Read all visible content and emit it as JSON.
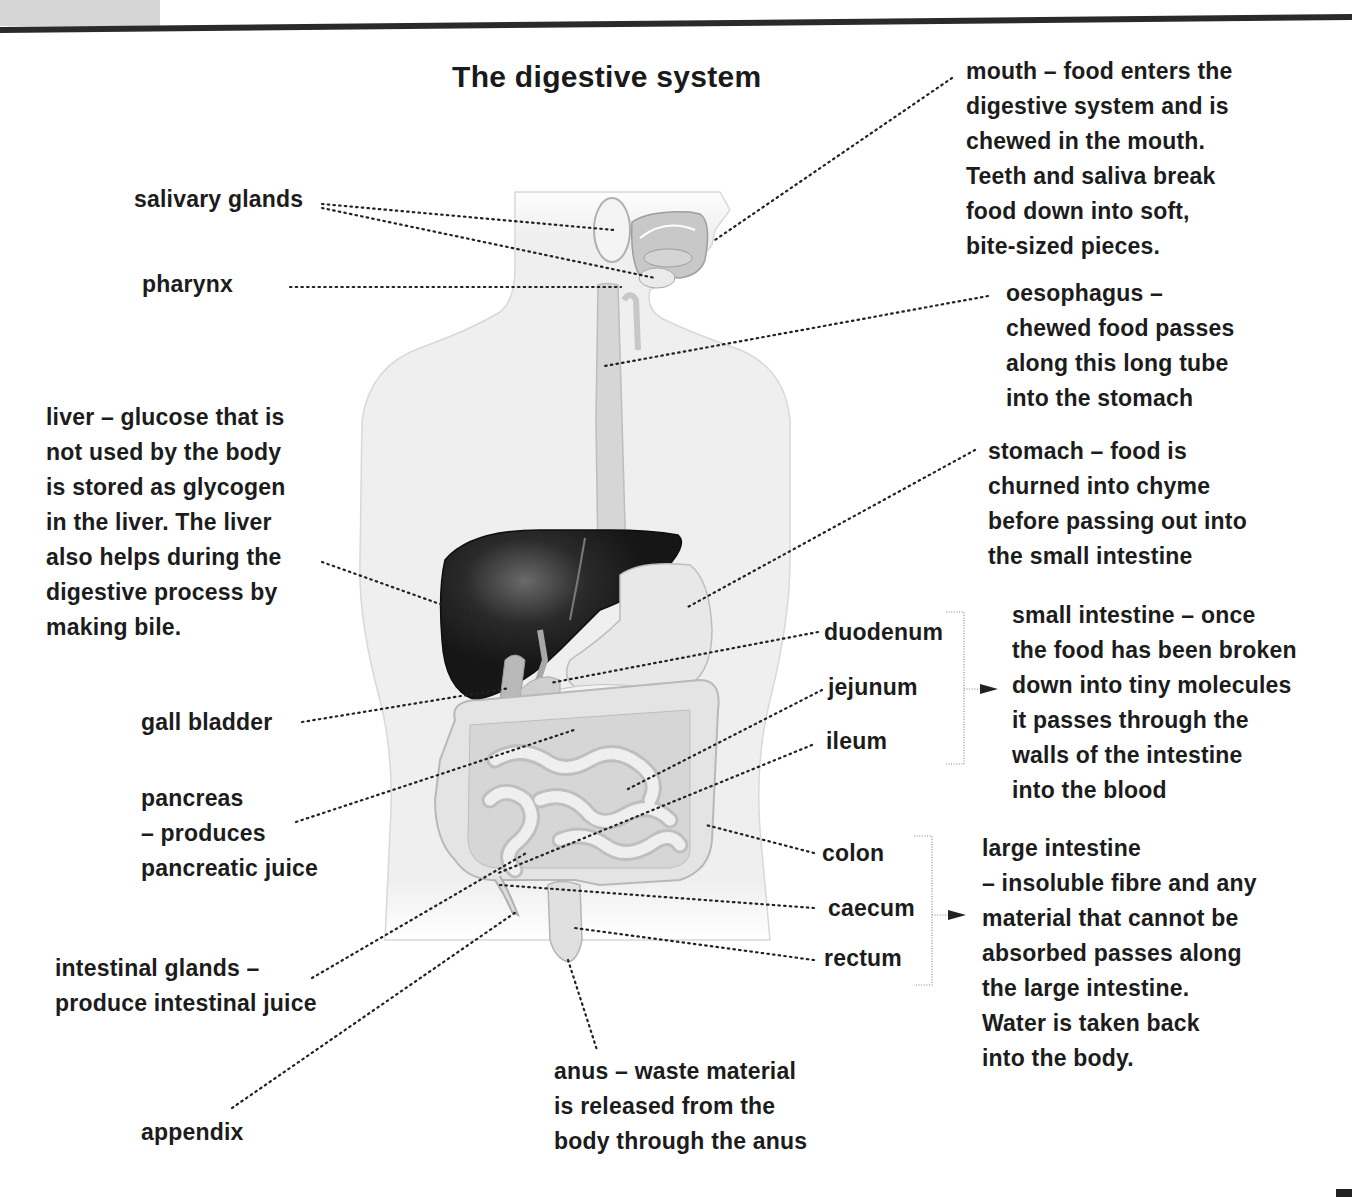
{
  "title": "The digestive system",
  "labels": {
    "mouth": {
      "lines": [
        "mouth – food enters the",
        "digestive system and is",
        "chewed in the mouth.",
        "Teeth and saliva break",
        "food down into soft,",
        "bite-sized pieces."
      ]
    },
    "salivary_glands": {
      "text": "salivary glands"
    },
    "pharynx": {
      "text": "pharynx"
    },
    "oesophagus": {
      "lines": [
        "oesophagus –",
        "chewed food passes",
        "along this long tube",
        "into the stomach"
      ]
    },
    "liver": {
      "line1_pre": "liver – ",
      "line1_bold": "glucose",
      "line1_post": " that is",
      "line2": "not used by the body",
      "line3_pre": "is stored as ",
      "line3_bold": "glycogen",
      "line4": "in the liver. The liver",
      "line5": "also helps during the",
      "line6": "digestive process by",
      "line7": "making bile."
    },
    "stomach": {
      "lines": [
        "stomach – food is",
        "churned into chyme",
        "before passing out into",
        "the small intestine"
      ]
    },
    "duodenum": {
      "text": "duodenum"
    },
    "jejunum": {
      "text": "jejunum"
    },
    "ileum": {
      "text": "ileum"
    },
    "small_intestine": {
      "lines": [
        "small intestine – once",
        "the food has been broken",
        "down into tiny molecules",
        "it passes through the",
        "walls of the intestine",
        "into the blood"
      ]
    },
    "gall_bladder": {
      "text": "gall bladder"
    },
    "pancreas": {
      "lines": [
        "pancreas",
        "– produces",
        "pancreatic juice"
      ]
    },
    "colon": {
      "text": "colon"
    },
    "caecum": {
      "text": "caecum"
    },
    "rectum": {
      "text": "rectum"
    },
    "large_intestine": {
      "lines": [
        "large intestine",
        "– insoluble fibre and any",
        "material that cannot be",
        "absorbed passes along",
        "the large intestine.",
        "Water is taken back",
        "into the body."
      ]
    },
    "intestinal_glands": {
      "lines": [
        "intestinal glands –",
        "produce intestinal juice"
      ]
    },
    "appendix": {
      "text": "appendix"
    },
    "anus": {
      "lines": [
        "anus – waste material",
        "is released from the",
        "body through the anus"
      ]
    }
  },
  "colors": {
    "body_fill": "#f0f0f0",
    "organ_fill": "#e2e2e2",
    "organ_stroke": "#bdbdbd",
    "liver_fill": "#1e1e1e",
    "text": "#1c1c1c"
  }
}
